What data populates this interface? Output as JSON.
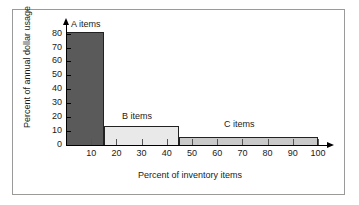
{
  "chart_data": {
    "type": "bar",
    "title": "",
    "subtitle": "",
    "xlabel": "Percent of inventory items",
    "ylabel": "Percent of annual dollar usage",
    "xlim": [
      0,
      105
    ],
    "ylim": [
      0,
      85
    ],
    "xticks": [
      "10",
      "20",
      "30",
      "40",
      "50",
      "60",
      "70",
      "80",
      "90",
      "100"
    ],
    "xtick_values": [
      10,
      20,
      30,
      40,
      50,
      60,
      70,
      80,
      90,
      100
    ],
    "yticks": [
      "0",
      "10",
      "20",
      "30",
      "40",
      "50",
      "60",
      "70",
      "80"
    ],
    "ytick_values": [
      0,
      10,
      20,
      30,
      40,
      50,
      60,
      70,
      80
    ],
    "grid": false,
    "legend": "inline-annotations",
    "bars": [
      {
        "name": "A items",
        "label": "A items",
        "x_start": 0,
        "x_end": 15,
        "value": 81,
        "color": "#5a5a5a"
      },
      {
        "name": "B items",
        "label": "B items",
        "x_start": 15,
        "x_end": 45,
        "value": 14,
        "color": "#e9e9e9"
      },
      {
        "name": "C items",
        "label": "C items",
        "x_start": 45,
        "x_end": 100,
        "value": 6,
        "color": "#c9c9c9"
      }
    ]
  },
  "figure": {
    "border_color": "#9a9a9a",
    "background": "#ffffff",
    "axis_color": "#000000"
  }
}
